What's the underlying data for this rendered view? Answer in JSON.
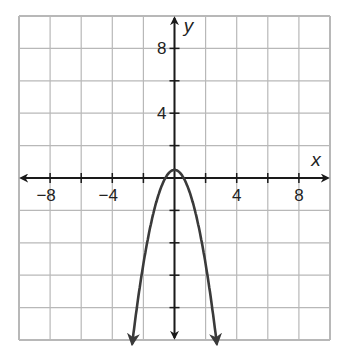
{
  "chart_data": {
    "type": "line",
    "title": "",
    "xlabel": "x",
    "ylabel": "y",
    "xlim": [
      -10,
      10
    ],
    "ylim": [
      -10,
      10
    ],
    "grid": true,
    "grid_step": 2,
    "x_tick_labels": [
      "−8",
      "−4",
      "4",
      "8"
    ],
    "x_tick_values": [
      -8,
      -4,
      4,
      8
    ],
    "y_tick_labels": [
      "8",
      "4"
    ],
    "y_tick_values": [
      8,
      4
    ],
    "series": [
      {
        "name": "parabola",
        "equation": "y ≈ -1.45x^2 + 0.5",
        "vertex": [
          0,
          0.5
        ],
        "opens": "down",
        "x": [
          -2.7,
          -2,
          -1.5,
          -1,
          -0.5,
          0,
          0.5,
          1,
          1.5,
          2,
          2.7
        ],
        "values": [
          -10.1,
          -5.3,
          -2.76,
          -0.95,
          0.14,
          0.5,
          0.14,
          -0.95,
          -2.76,
          -5.3,
          -10.1
        ],
        "arrows_at_ends": true
      }
    ],
    "legend": null
  },
  "colors": {
    "grid": "#b8b8b8",
    "axis": "#1a1a1a",
    "curve": "#3a3a3a",
    "background": "#ffffff"
  },
  "labels": {
    "x_axis": "x",
    "y_axis": "y"
  }
}
